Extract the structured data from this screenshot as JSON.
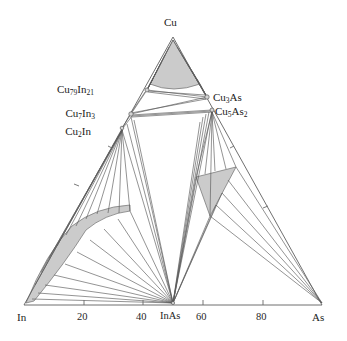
{
  "figure": {
    "kind": "ternary-phase-diagram",
    "background_color": "#ffffff",
    "line_color": "#555555",
    "axis_color": "#666666",
    "shade_color": "#cccccc",
    "shade_stroke": "#777777",
    "text_color": "#1a1a1a"
  },
  "vertices": {
    "top": {
      "label": "Cu",
      "x": 173,
      "y": 37,
      "label_x": 164,
      "label_y": 17
    },
    "bottom_left": {
      "label": "In",
      "x": 24,
      "y": 305,
      "label_x": 17,
      "label_y": 312
    },
    "bottom_right": {
      "label": "As",
      "x": 322,
      "y": 305,
      "label_x": 312,
      "label_y": 312
    }
  },
  "axis": {
    "name": "bottom-axis",
    "ticks": [
      {
        "label": "20",
        "x": 84,
        "label_x": 77,
        "label_y": 312
      },
      {
        "label": "40",
        "x": 143,
        "label_x": 136,
        "label_y": 312
      },
      {
        "label": "InAs",
        "x": 173,
        "label_x": 161,
        "label_y": 311
      },
      {
        "label": "60",
        "x": 203,
        "label_x": 196,
        "label_y": 312
      },
      {
        "label": "80",
        "x": 263,
        "label_x": 256,
        "label_y": 312
      }
    ]
  },
  "compounds": [
    {
      "id": "cu79in21",
      "html": "Cu<sub>79</sub>In<sub>21</sub>",
      "node_x": 147,
      "node_y": 90,
      "label_x": 94,
      "label_y": 84,
      "anchor": "right"
    },
    {
      "id": "cu7in3",
      "html": "Cu<sub>7</sub>In<sub>3</sub>",
      "node_x": 131,
      "node_y": 114,
      "label_x": 95,
      "label_y": 108,
      "anchor": "right"
    },
    {
      "id": "cu2in",
      "html": "Cu<sub>2</sub>In",
      "node_x": 122,
      "node_y": 128,
      "label_x": 91,
      "label_y": 126,
      "anchor": "right"
    },
    {
      "id": "cu3as",
      "html": "Cu<sub>3</sub>As",
      "node_x": 207,
      "node_y": 97,
      "label_x": 213,
      "label_y": 92,
      "anchor": "left"
    },
    {
      "id": "cu5as2",
      "html": "Cu<sub>5</sub>As<sub>2</sub>",
      "node_x": 212,
      "node_y": 110,
      "label_x": 215,
      "label_y": 106,
      "anchor": "left"
    }
  ],
  "inas_point": {
    "name": "InAs",
    "x": 173,
    "y": 303
  },
  "shaded_regions": [
    {
      "name": "cu-solid-solution",
      "note": "gray field at Cu apex"
    },
    {
      "name": "in-rich-liquid",
      "note": "curved gray band near In vertex"
    },
    {
      "name": "as-rich-liquid",
      "note": "gray triangle in As-rich region"
    }
  ],
  "chart_data": {
    "type": "scatter",
    "title": "",
    "xlabel": "",
    "ylabel": "",
    "system": [
      "Cu",
      "In",
      "As"
    ],
    "categories": [
      "In",
      "20",
      "40",
      "InAs",
      "60",
      "80",
      "As"
    ],
    "values": [
      0,
      20,
      40,
      50,
      60,
      80,
      100
    ],
    "series": [
      {
        "name": "intermetallic-compounds",
        "points": [
          {
            "label": "Cu79In21",
            "side": "Cu-In"
          },
          {
            "label": "Cu7In3",
            "side": "Cu-In"
          },
          {
            "label": "Cu2In",
            "side": "Cu-In"
          },
          {
            "label": "Cu3As",
            "side": "Cu-As"
          },
          {
            "label": "Cu5As2",
            "side": "Cu-As"
          }
        ]
      },
      {
        "name": "tie-line-convergence",
        "points": [
          {
            "label": "InAs",
            "side": "In-As"
          }
        ]
      }
    ],
    "grid": false,
    "legend": "none"
  }
}
